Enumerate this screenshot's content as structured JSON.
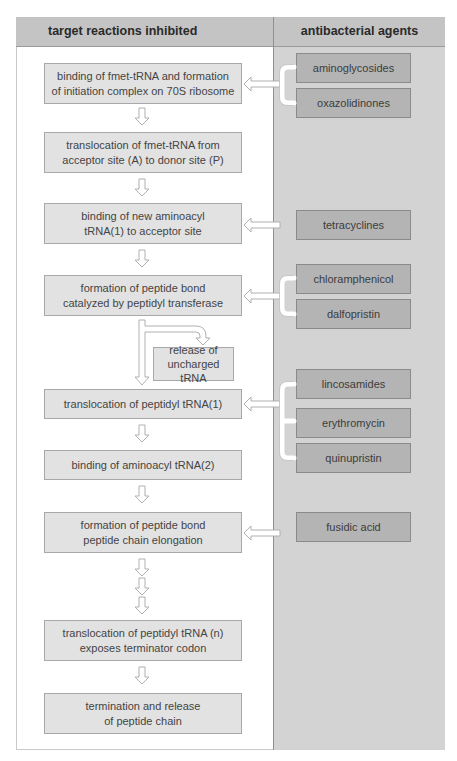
{
  "header": {
    "left_title": "target reactions inhibited",
    "right_title": "antibacterial agents"
  },
  "steps": [
    {
      "line1": "binding of fmet-tRNA and formation",
      "line2": "of initiation complex on 70S ribosome"
    },
    {
      "line1": "translocation of fmet-tRNA from",
      "line2": "acceptor site (A) to donor site (P)"
    },
    {
      "line1": "binding of new aminoacyl",
      "line2": "tRNA(1) to acceptor site"
    },
    {
      "line1": "formation of peptide bond",
      "line2": "catalyzed by peptidyl transferase"
    },
    {
      "line1": "translocation of peptidyl tRNA(1)",
      "line2": ""
    },
    {
      "line1": "binding of aminoacyl tRNA(2)",
      "line2": ""
    },
    {
      "line1": "formation of peptide bond",
      "line2": "peptide chain elongation"
    },
    {
      "line1": "translocation of peptidyl tRNA (n)",
      "line2": "exposes terminator codon"
    },
    {
      "line1": "termination and release",
      "line2": "of peptide chain"
    }
  ],
  "side_step": {
    "line1": "release of",
    "line2": "uncharged tRNA"
  },
  "agents": [
    {
      "label": "aminoglycosides",
      "targets_step": 0
    },
    {
      "label": "oxazolidinones",
      "targets_step": 0
    },
    {
      "label": "tetracyclines",
      "targets_step": 2
    },
    {
      "label": "chloramphenicol",
      "targets_step": 3
    },
    {
      "label": "dalfopristin",
      "targets_step": 3
    },
    {
      "label": "lincosamides",
      "targets_step": 4
    },
    {
      "label": "erythromycin",
      "targets_step": 4
    },
    {
      "label": "quinupristin",
      "targets_step": 4
    },
    {
      "label": "fusidic acid",
      "targets_step": 6
    }
  ],
  "colors": {
    "header_bg": "#c4c4c4",
    "right_column_bg": "#d3d3d3",
    "step_box_bg": "#e2e2e2",
    "agent_box_bg": "#b4b4b4",
    "arrow_fill": "#ffffff",
    "arrow_stroke": "#b0b0b0"
  }
}
